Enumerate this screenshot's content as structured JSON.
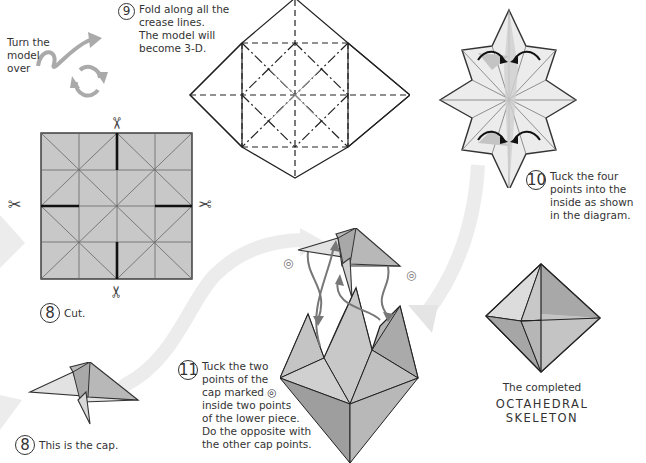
{
  "instructions": {
    "turn_over": {
      "lines": [
        "Turn the",
        "model",
        "over"
      ],
      "icon": "turn-over-arrows-icon"
    },
    "step9": {
      "number": "9",
      "lines": [
        "Fold along all the",
        "crease lines.",
        "The model will",
        "become 3-D."
      ]
    },
    "step8_cut": {
      "number": "8",
      "label": "Cut."
    },
    "step8_cap": {
      "number": "8",
      "label": "This is the cap."
    },
    "step10": {
      "number": "10",
      "lines": [
        "Tuck the four",
        "points into the",
        "inside as shown",
        "in the diagram."
      ]
    },
    "step11": {
      "number": "11",
      "lines": [
        "Tuck the two",
        "points of the",
        "cap marked ◎",
        "inside two points",
        "of the lower piece.",
        "Do the opposite with",
        "the other cap points."
      ]
    },
    "final": {
      "caption": "The completed",
      "name_line1": "OCTAHEDRAL",
      "name_line2": "SKELETON"
    }
  },
  "symbols": {
    "scissors": "✂",
    "target_mark": "◎"
  },
  "colors": {
    "paper_gray": "#c8c8c8",
    "paper_light": "#e6e6e6",
    "paper_dark": "#9a9a9a",
    "line": "#222222",
    "flow_arrow": "#e8e8e8",
    "move_arrow": "#777777"
  }
}
